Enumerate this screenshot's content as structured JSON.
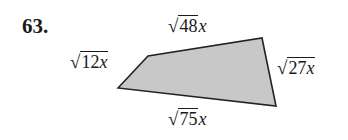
{
  "problem_number": "63.",
  "figure": {
    "type": "quadrilateral",
    "fill_color": "#c8c8c8",
    "stroke_color": "#222222",
    "sides": [
      {
        "position": "top",
        "radicand": "48",
        "outside": "x"
      },
      {
        "position": "right",
        "radicand": "27x",
        "outside": ""
      },
      {
        "position": "bottom",
        "radicand": "75",
        "outside": "x"
      },
      {
        "position": "left",
        "radicand": "12x",
        "outside": ""
      }
    ]
  },
  "labels": {
    "top_num": "48",
    "top_var": "x",
    "right_num": "27",
    "right_var": "x",
    "bottom_num": "75",
    "bottom_var": "x",
    "left_num": "12",
    "left_var": "x",
    "radical": "√"
  }
}
